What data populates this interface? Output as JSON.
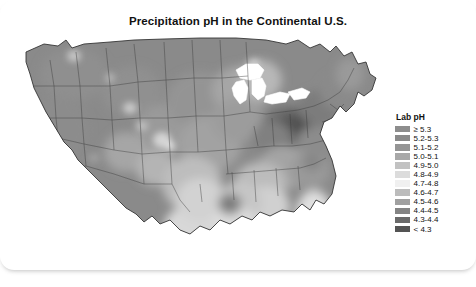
{
  "card": {
    "title": "Precipitation pH in the Continental U.S."
  },
  "legend": {
    "title": "Lab pH",
    "entries": [
      {
        "label": "≥ 5.3",
        "color": "#8d8d8d"
      },
      {
        "label": "5.2-5.3",
        "color": "#8a8a8a"
      },
      {
        "label": "5.1-5.2",
        "color": "#959595"
      },
      {
        "label": "5.0-5.1",
        "color": "#a8a8a8"
      },
      {
        "label": "4.9-5.0",
        "color": "#c2c2c2"
      },
      {
        "label": "4.8-4.9",
        "color": "#dcdcdc"
      },
      {
        "label": "4.7-4.8",
        "color": "#f0f0f0"
      },
      {
        "label": "4.6-4.7",
        "color": "#bcbcbc"
      },
      {
        "label": "4.5-4.6",
        "color": "#a0a0a0"
      },
      {
        "label": "4.4-4.5",
        "color": "#848484"
      },
      {
        "label": "4.3-4.4",
        "color": "#6a6a6a"
      },
      {
        "label": "< 4.3",
        "color": "#545454"
      }
    ]
  },
  "chart_data": {
    "type": "heatmap",
    "title": "Precipitation pH in the Continental U.S.",
    "xlabel": "",
    "ylabel": "",
    "legend_title": "Lab pH",
    "legend_position": "right",
    "grid": false,
    "colorscale": "grayscale-diverging",
    "bins": [
      {
        "label": "≥ 5.3",
        "min": 5.3,
        "max": null,
        "color": "#8d8d8d"
      },
      {
        "label": "5.2-5.3",
        "min": 5.2,
        "max": 5.3,
        "color": "#8a8a8a"
      },
      {
        "label": "5.1-5.2",
        "min": 5.1,
        "max": 5.2,
        "color": "#959595"
      },
      {
        "label": "5.0-5.1",
        "min": 5.0,
        "max": 5.1,
        "color": "#a8a8a8"
      },
      {
        "label": "4.9-5.0",
        "min": 4.9,
        "max": 5.0,
        "color": "#c2c2c2"
      },
      {
        "label": "4.8-4.9",
        "min": 4.8,
        "max": 4.9,
        "color": "#dcdcdc"
      },
      {
        "label": "4.7-4.8",
        "min": 4.7,
        "max": 4.8,
        "color": "#f0f0f0"
      },
      {
        "label": "4.6-4.7",
        "min": 4.6,
        "max": 4.7,
        "color": "#bcbcbc"
      },
      {
        "label": "4.5-4.6",
        "min": 4.5,
        "max": 4.6,
        "color": "#a0a0a0"
      },
      {
        "label": "4.4-4.5",
        "min": 4.4,
        "max": 4.5,
        "color": "#848484"
      },
      {
        "label": "4.3-4.4",
        "min": 4.3,
        "max": 4.4,
        "color": "#6a6a6a"
      },
      {
        "label": "< 4.3",
        "min": null,
        "max": 4.3,
        "color": "#545454"
      }
    ],
    "regions": [
      {
        "name": "Pacific Northwest",
        "ph_bin": "5.2-5.3"
      },
      {
        "name": "California",
        "ph_bin": "5.2-5.3"
      },
      {
        "name": "Great Basin / Nevada",
        "ph_bin": "5.2-5.3"
      },
      {
        "name": "Northern Rockies",
        "ph_bin": "5.2-5.3"
      },
      {
        "name": "Colorado Plateau",
        "ph_bin": "5.0-5.1"
      },
      {
        "name": "Northern Plains",
        "ph_bin": "5.2-5.3"
      },
      {
        "name": "Central Plains",
        "ph_bin": "5.1-5.2"
      },
      {
        "name": "Texas",
        "ph_bin": "4.9-5.0"
      },
      {
        "name": "Gulf Coast / Louisiana",
        "ph_bin": "4.5-4.6"
      },
      {
        "name": "Upper Midwest",
        "ph_bin": "4.9-5.0"
      },
      {
        "name": "Illinois / Indiana",
        "ph_bin": "4.5-4.6"
      },
      {
        "name": "Ohio Valley",
        "ph_bin": "< 4.3"
      },
      {
        "name": "Western Pennsylvania",
        "ph_bin": "< 4.3"
      },
      {
        "name": "West Virginia",
        "ph_bin": "4.3-4.4"
      },
      {
        "name": "New York / New England",
        "ph_bin": "4.4-4.5"
      },
      {
        "name": "Mid-Atlantic",
        "ph_bin": "4.4-4.5"
      },
      {
        "name": "Carolinas",
        "ph_bin": "4.6-4.7"
      },
      {
        "name": "Deep South",
        "ph_bin": "4.8-4.9"
      },
      {
        "name": "Florida",
        "ph_bin": "4.9-5.0"
      }
    ]
  }
}
